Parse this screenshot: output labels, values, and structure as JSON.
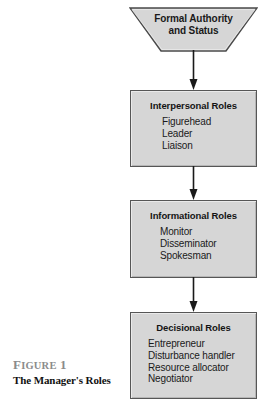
{
  "figure": {
    "caption_number_full": "FIGURE 1",
    "caption_number_lead": "F",
    "caption_number_rest": "IGURE",
    "caption_number_index": "1",
    "caption_title": "The Manager's Roles",
    "caption_number_color": "#8b8b8b",
    "caption_title_color": "#111111"
  },
  "diagram": {
    "type": "flowchart",
    "orientation": "top-to-bottom",
    "background_color": "#ffffff",
    "node_fill_color": "#d6d6d6",
    "node_border_color": "#565656",
    "connector_color": "#1a1a1a",
    "source_node": {
      "shape": "trapezoid",
      "label_line_1": "Formal Authority",
      "label_line_2": "and Status"
    },
    "nodes": [
      {
        "id": "interpersonal",
        "shape": "rectangle",
        "title": "Interpersonal Roles",
        "items": [
          "Figurehead",
          "Leader",
          "Liaison"
        ]
      },
      {
        "id": "informational",
        "shape": "rectangle",
        "title": "Informational Roles",
        "items": [
          "Monitor",
          "Disseminator",
          "Spokesman"
        ]
      },
      {
        "id": "decisional",
        "shape": "rectangle",
        "title": "Decisional Roles",
        "items": [
          "Entrepreneur",
          "Disturbance handler",
          "Resource allocator",
          "Negotiator"
        ]
      }
    ],
    "connectors": [
      {
        "id": "arrow-1",
        "from": "source",
        "to": "interpersonal",
        "arrowhead": "solid-down"
      },
      {
        "id": "arrow-2",
        "from": "interpersonal",
        "to": "informational",
        "arrowhead": "solid-down"
      },
      {
        "id": "arrow-3",
        "from": "informational",
        "to": "decisional",
        "arrowhead": "solid-down"
      }
    ]
  }
}
